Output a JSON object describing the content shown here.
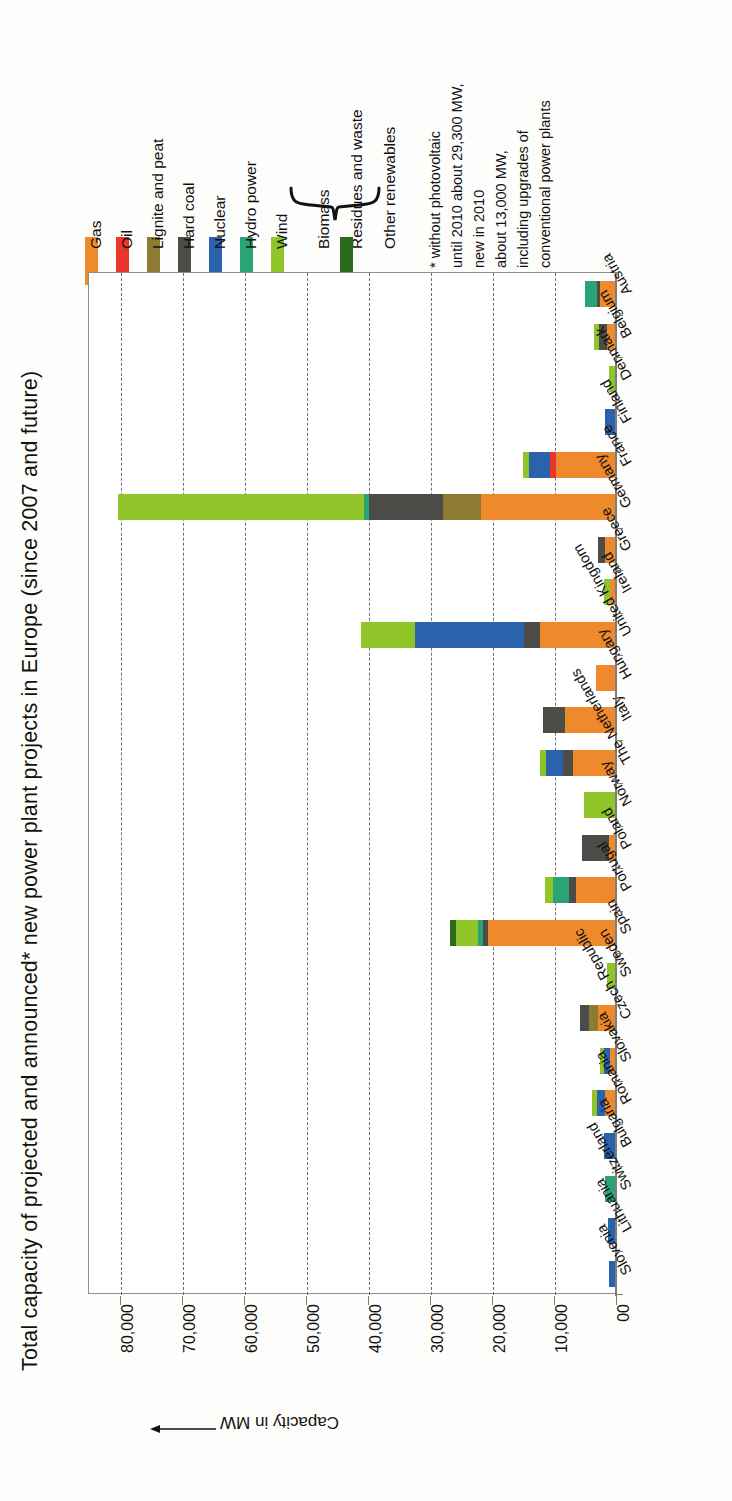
{
  "chart_data": {
    "type": "bar",
    "orientation": "horizontal-stacked",
    "title": "Total capacity of projected and announced* new power plant projects in Europe (since 2007 and future)",
    "xlabel": "",
    "ylabel": "Capacity in MW",
    "axis_arrow": "←",
    "grid": true,
    "legend_position": "top",
    "xlim": [
      0,
      85000
    ],
    "ticks": [
      "00",
      "10,000",
      "20,000",
      "30,000",
      "40,000",
      "50,000",
      "60,000",
      "70,000",
      "80,000"
    ],
    "tick_values": [
      0,
      10000,
      20000,
      30000,
      40000,
      50000,
      60000,
      70000,
      80000
    ],
    "categories": [
      "Austria",
      "Belgium",
      "Denmark",
      "Finland",
      "France",
      "Germany",
      "Greece",
      "Ireland",
      "United Kingdom",
      "Hungary",
      "Italy",
      "The Netherlands",
      "Norway",
      "Poland",
      "Portugal",
      "Spain",
      "Sweden",
      "Czech Republic",
      "Slovakia",
      "Romania",
      "Bulgaria",
      "Switzerland",
      "Lithuania",
      "Slovenia"
    ],
    "series": [
      {
        "name": "Gas",
        "color": "#ee8a2b",
        "values": [
          2600,
          1400,
          0,
          0,
          9600,
          21800,
          1800,
          900,
          12200,
          3300,
          8200,
          7000,
          0,
          1100,
          6400,
          20600,
          0,
          2900,
          900,
          1700,
          0,
          0,
          0,
          0
        ]
      },
      {
        "name": "Oil",
        "color": "#e8372a",
        "values": [
          0,
          0,
          0,
          0,
          1100,
          0,
          0,
          0,
          0,
          0,
          0,
          0,
          0,
          0,
          0,
          0,
          0,
          0,
          0,
          0,
          0,
          0,
          0,
          0
        ]
      },
      {
        "name": "Lignite and peat",
        "color": "#8d7b31",
        "values": [
          0,
          0,
          0,
          0,
          0,
          6100,
          0,
          0,
          0,
          0,
          0,
          0,
          0,
          0,
          0,
          0,
          0,
          1500,
          0,
          0,
          0,
          0,
          0,
          0
        ]
      },
      {
        "name": "Hard coal",
        "color": "#4c4c48",
        "values": [
          400,
          1300,
          0,
          0,
          0,
          11900,
          1100,
          0,
          2700,
          0,
          3500,
          1600,
          0,
          4400,
          1200,
          900,
          0,
          1400,
          0,
          0,
          0,
          0,
          0,
          0
        ]
      },
      {
        "name": "Nuclear",
        "color": "#2b62ad",
        "values": [
          0,
          0,
          0,
          1800,
          3400,
          0,
          0,
          0,
          17600,
          0,
          0,
          2700,
          0,
          0,
          0,
          0,
          0,
          0,
          1000,
          1400,
          2000,
          0,
          1300,
          1200
        ]
      },
      {
        "name": "Hydro power",
        "color": "#2aa476",
        "values": [
          2000,
          0,
          0,
          0,
          0,
          900,
          0,
          0,
          0,
          0,
          0,
          0,
          0,
          0,
          2600,
          700,
          0,
          0,
          0,
          0,
          0,
          1800,
          0,
          0
        ]
      },
      {
        "name": "Wind",
        "color": "#90c52a",
        "values": [
          0,
          800,
          1200,
          0,
          900,
          39700,
          0,
          1000,
          8600,
          0,
          0,
          900,
          5200,
          0,
          1200,
          3600,
          1400,
          0,
          700,
          700,
          0,
          0,
          0,
          0
        ]
      },
      {
        "name": "Biomass / Residues and waste / Other renewables",
        "color": "#2c6b1f",
        "values": [
          0,
          0,
          0,
          0,
          0,
          0,
          0,
          0,
          0,
          0,
          0,
          0,
          0,
          0,
          0,
          900,
          0,
          0,
          0,
          0,
          0,
          0,
          0,
          0
        ]
      }
    ]
  },
  "legend": {
    "items": [
      {
        "label": "Gas",
        "color": "#ee8a2b"
      },
      {
        "label": "Oil",
        "color": "#e8372a"
      },
      {
        "label": "Lignite and peat",
        "color": "#8d7b31"
      },
      {
        "label": "Hard coal",
        "color": "#4c4c48"
      },
      {
        "label": "Nuclear",
        "color": "#2b62ad"
      },
      {
        "label": "Hydro power",
        "color": "#2aa476"
      },
      {
        "label": "Wind",
        "color": "#90c52a"
      }
    ],
    "grouped": {
      "labels": [
        "Biomass",
        "Residues and waste",
        "Other renewables"
      ],
      "color": "#2c6b1f"
    }
  },
  "footnote": {
    "lines": [
      "* without photovoltaic",
      "until 2010 about 29,300 MW,",
      "new in 2010",
      "about 13,000 MW,",
      "including upgrades of",
      "conventional power plants"
    ]
  }
}
